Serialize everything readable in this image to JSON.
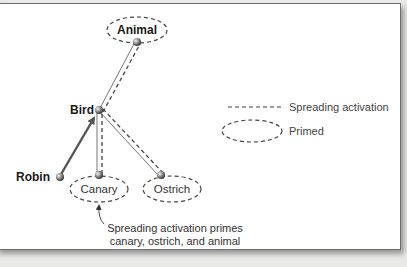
{
  "diagram": {
    "nodes": {
      "animal": "Animal",
      "bird": "Bird",
      "robin": "Robin",
      "canary": "Canary",
      "ostrich": "Ostrich"
    },
    "legend": {
      "spreading": "Spreading activation",
      "primed": "Primed"
    },
    "caption": {
      "line1": "Spreading activation primes",
      "line2": "canary, ostrich, and animal"
    }
  }
}
